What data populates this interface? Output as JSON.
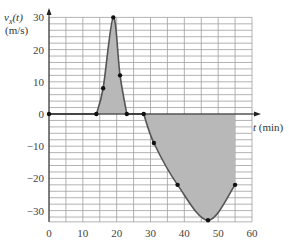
{
  "chart_data": {
    "type": "line",
    "title": "",
    "xlabel": "t (min)",
    "ylabel": "v_x(t)",
    "ylabel_unit": "(m/s)",
    "xlim": [
      0,
      60
    ],
    "ylim": [
      -33.5,
      30
    ],
    "x_ticks": [
      0,
      10,
      20,
      30,
      40,
      50,
      60
    ],
    "y_ticks": [
      30,
      20,
      10,
      0,
      -10,
      -20,
      -30
    ],
    "grid": {
      "x_step": 5,
      "y_step": 2
    },
    "marked_points": [
      {
        "t": 0,
        "v": 0
      },
      {
        "t": 14,
        "v": 0
      },
      {
        "t": 16,
        "v": 8
      },
      {
        "t": 19,
        "v": 30
      },
      {
        "t": 21,
        "v": 12
      },
      {
        "t": 23,
        "v": 0
      },
      {
        "t": 28,
        "v": 0
      },
      {
        "t": 31,
        "v": -9
      },
      {
        "t": 38,
        "v": -22
      },
      {
        "t": 47,
        "v": -33
      },
      {
        "t": 55,
        "v": -22
      }
    ],
    "shaded_regions": [
      {
        "from_t": 14,
        "to_t": 23,
        "sign": "positive"
      },
      {
        "from_t": 28,
        "to_t": 55,
        "sign": "negative"
      }
    ],
    "colors": {
      "curve": "#555555",
      "shade": "#b8b8b8",
      "grid": "#a0a0a0",
      "axis": "#222222",
      "point": "#111111"
    }
  },
  "labels": {
    "y_axis_name": "v",
    "y_axis_sub": "x",
    "y_axis_arg": "(t)",
    "y_axis_unit": "(m/s)",
    "x_axis_var": "t",
    "x_axis_unit": " (min)"
  }
}
